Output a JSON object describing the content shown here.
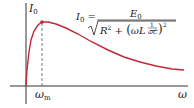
{
  "chart_data": {
    "type": "line",
    "title": "",
    "xlabel": "ω",
    "ylabel": "I0",
    "series": [
      {
        "name": "I0(ω)",
        "color": "#c0283a",
        "x_px": [
          26,
          27,
          29,
          31,
          34,
          38,
          42,
          48,
          56,
          66,
          78,
          92,
          108,
          124,
          140,
          156,
          172,
          184
        ],
        "y_px": [
          85,
          70,
          52,
          40,
          31,
          25,
          22,
          22,
          24,
          28,
          34,
          42,
          50,
          57,
          62,
          66,
          69,
          70
        ]
      }
    ],
    "annotations": {
      "peak_label": "ωm",
      "formula": "I0 = E0 / sqrt(R^2 + (ωL − 1/(ωC))^2)",
      "dashed_line_at": "ωm"
    },
    "axis": {
      "x_tick_labels": [
        "ωm",
        "ω"
      ],
      "grid": false
    }
  },
  "labels": {
    "y_axis": "I",
    "y_axis_sub": "0",
    "x_peak": "ω",
    "x_peak_sub": "m",
    "x_axis": "ω"
  },
  "formula": {
    "lhs": "I",
    "lhs_sub": "0",
    "eq": "=",
    "num": "E",
    "num_sub": "0",
    "den_r": "R",
    "den_r_exp": "2",
    "den_plus": "+",
    "den_inner": "ωL −",
    "frac_num": "1",
    "frac_den": "ωC",
    "den_exp": "2"
  },
  "colors": {
    "curve": "#c0283a",
    "axis": "#333333",
    "dash": "#555555"
  }
}
